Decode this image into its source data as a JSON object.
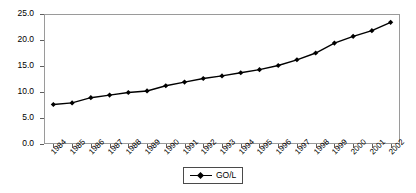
{
  "chart_data": {
    "type": "line",
    "title": "",
    "xlabel": "",
    "ylabel": "",
    "ylim": [
      0.0,
      25.0
    ],
    "ytick_step": 5.0,
    "ytick_labels": [
      "0.0",
      "5.0",
      "10.0",
      "15.0",
      "20.0",
      "25.0"
    ],
    "grid": false,
    "legend_position": "bottom-center",
    "categories": [
      "1984",
      "1985",
      "1986",
      "1987",
      "1988",
      "1989",
      "1990",
      "1991",
      "1992",
      "1993",
      "1994",
      "1995",
      "1996",
      "1997",
      "1998",
      "1999",
      "2000",
      "2001",
      "2002"
    ],
    "series": [
      {
        "name": "GO/L",
        "marker": "diamond",
        "color": "#000000",
        "values": [
          7.6,
          7.9,
          8.9,
          9.4,
          9.9,
          10.2,
          11.2,
          11.9,
          12.6,
          13.1,
          13.7,
          14.3,
          15.1,
          16.2,
          17.5,
          19.4,
          20.7,
          21.8,
          23.4
        ]
      }
    ]
  },
  "legend": {
    "entries": [
      {
        "label": "GO/L"
      }
    ]
  },
  "colors": {
    "series": "#000000",
    "frame": "#9a9a9a",
    "tick": "#5f5f5f",
    "background": "#ffffff"
  }
}
